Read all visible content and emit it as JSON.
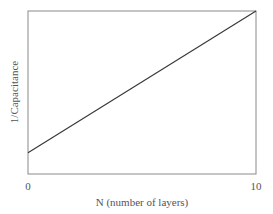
{
  "chart_data": {
    "type": "line",
    "title": "",
    "xlabel": "N (number of layers)",
    "ylabel": "1/Capacitance",
    "x_ticks": [
      "0",
      "10"
    ],
    "xlim": [
      0,
      10
    ],
    "y_ticks": [],
    "grid": false,
    "legend": null,
    "series": [
      {
        "name": "1/Capacitance vs N",
        "x": [
          0,
          10
        ],
        "y_relative": [
          0.13,
          1.0
        ],
        "note": "linear increase; y-axis unlabeled (relative units, fraction of plot height)"
      }
    ]
  },
  "labels": {
    "xlabel": "N (number of layers)",
    "ylabel": "1/Capacitance",
    "xtick0": "0",
    "xtick1": "10"
  },
  "colors": {
    "axis": "#8a8a8a",
    "line": "#3a3a3a",
    "text": "#555555"
  }
}
